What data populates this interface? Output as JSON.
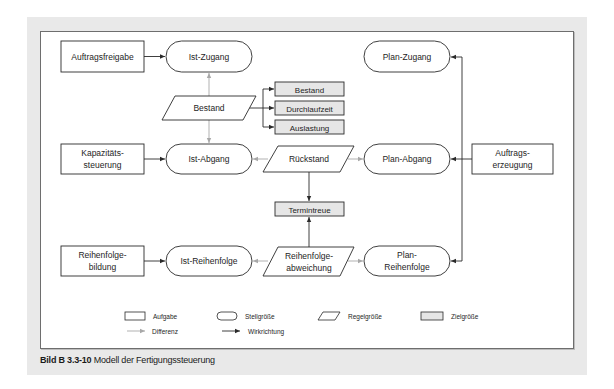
{
  "figure": {
    "caption_label": "Bild B 3.3-10",
    "caption_text": "Modell der Fertigungssteuerung"
  },
  "nodes": {
    "auftragsfreigabe": {
      "type": "Aufgabe",
      "lines": [
        "Auftragsfreigabe"
      ]
    },
    "kapazitaetssteuerung": {
      "type": "Aufgabe",
      "lines": [
        "Kapazitäts-",
        "steuerung"
      ]
    },
    "reihenfolgebildung": {
      "type": "Aufgabe",
      "lines": [
        "Reihenfolge-",
        "bildung"
      ]
    },
    "auftragserzeugung": {
      "type": "Aufgabe",
      "lines": [
        "Auftrags-",
        "erzeugung"
      ]
    },
    "ist_zugang": {
      "type": "Stellgröße",
      "lines": [
        "Ist-Zugang"
      ]
    },
    "ist_abgang": {
      "type": "Stellgröße",
      "lines": [
        "Ist-Abgang"
      ]
    },
    "ist_reihenfolge": {
      "type": "Stellgröße",
      "lines": [
        "Ist-Reihenfolge"
      ]
    },
    "plan_zugang": {
      "type": "Stellgröße",
      "lines": [
        "Plan-Zugang"
      ]
    },
    "plan_abgang": {
      "type": "Stellgröße",
      "lines": [
        "Plan-Abgang"
      ]
    },
    "plan_reihenfolge": {
      "type": "Stellgröße",
      "lines": [
        "Plan-",
        "Reihenfolge"
      ]
    },
    "bestand": {
      "type": "Regelgröße",
      "lines": [
        "Bestand"
      ]
    },
    "rueckstand": {
      "type": "Regelgröße",
      "lines": [
        "Rückstand"
      ]
    },
    "reihenfolgeabweichung": {
      "type": "Regelgröße",
      "lines": [
        "Reihenfolge-",
        "abweichung"
      ]
    },
    "ziel_bestand": {
      "type": "Zielgröße",
      "lines": [
        "Bestand"
      ]
    },
    "ziel_durchlaufzeit": {
      "type": "Zielgröße",
      "lines": [
        "Durchlaufzeit"
      ]
    },
    "ziel_auslastung": {
      "type": "Zielgröße",
      "lines": [
        "Auslastung"
      ]
    },
    "ziel_termintreue": {
      "type": "Zielgröße",
      "lines": [
        "Termintreue"
      ]
    }
  },
  "edges": [
    {
      "from": "Auftragsfreigabe",
      "to": "Ist-Zugang",
      "kind": "Wirkrichtung"
    },
    {
      "from": "Kapazitätssteuerung",
      "to": "Ist-Abgang",
      "kind": "Wirkrichtung"
    },
    {
      "from": "Reihenfolgebildung",
      "to": "Ist-Reihenfolge",
      "kind": "Wirkrichtung"
    },
    {
      "from": "Auftragserzeugung",
      "to": "Plan-Zugang",
      "kind": "Wirkrichtung"
    },
    {
      "from": "Auftragserzeugung",
      "to": "Plan-Abgang",
      "kind": "Wirkrichtung"
    },
    {
      "from": "Auftragserzeugung",
      "to": "Plan-Reihenfolge",
      "kind": "Wirkrichtung"
    },
    {
      "from": "Bestand",
      "to": "Ist-Zugang",
      "kind": "Differenz"
    },
    {
      "from": "Bestand",
      "to": "Ist-Abgang",
      "kind": "Differenz"
    },
    {
      "from": "Bestand",
      "to": "Zielgröße Bestand",
      "kind": "Wirkrichtung"
    },
    {
      "from": "Bestand",
      "to": "Durchlaufzeit",
      "kind": "Wirkrichtung"
    },
    {
      "from": "Bestand",
      "to": "Auslastung",
      "kind": "Wirkrichtung"
    },
    {
      "from": "Rückstand",
      "to": "Ist-Abgang",
      "kind": "Differenz"
    },
    {
      "from": "Rückstand",
      "to": "Plan-Abgang",
      "kind": "Differenz"
    },
    {
      "from": "Rückstand",
      "to": "Termintreue",
      "kind": "Wirkrichtung"
    },
    {
      "from": "Reihenfolgeabweichung",
      "to": "Ist-Reihenfolge",
      "kind": "Differenz"
    },
    {
      "from": "Reihenfolgeabweichung",
      "to": "Plan-Reihenfolge",
      "kind": "Differenz"
    },
    {
      "from": "Reihenfolgeabweichung",
      "to": "Termintreue",
      "kind": "Wirkrichtung"
    }
  ],
  "legend": {
    "aufgabe": "Aufgabe",
    "stellgroesse": "Stellgröße",
    "regelgroesse": "Regelgröße",
    "zielgroesse": "Zielgröße",
    "differenz": "Differenz",
    "wirkrichtung": "Wirkrichtung"
  },
  "colors": {
    "line": "#2a2a2a",
    "differenz_line": "#a8a8a8",
    "zielgroesse_fill": "#e6e6e6",
    "panel_bg": "#e9e9e9",
    "frame_border": "#6e6e6e"
  }
}
